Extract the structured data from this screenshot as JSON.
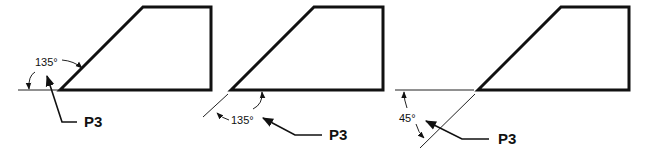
{
  "diagram": {
    "panels": [
      {
        "angle_label": "135°",
        "point_label": "P3"
      },
      {
        "angle_label": "135°",
        "point_label": "P3"
      },
      {
        "angle_label": "45°",
        "point_label": "P3"
      }
    ]
  }
}
